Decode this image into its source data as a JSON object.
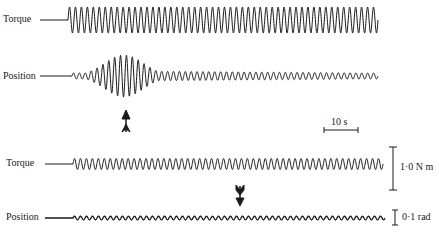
{
  "chart_data": {
    "type": "line",
    "title": "",
    "panels": [
      {
        "name": "upper",
        "traces": [
          {
            "label": "Torque",
            "baseline_y": 20,
            "start_x": 68,
            "end_x": 378,
            "amplitude": "constant large",
            "cycles": 52
          },
          {
            "label": "Position",
            "baseline_y": 76,
            "start_x": 72,
            "end_x": 378,
            "amplitude": "grows to peak near arrow then decays to small steady",
            "cycles": 52
          }
        ],
        "marker": {
          "type": "double-headed vertical arrow",
          "x": 125
        }
      },
      {
        "name": "lower",
        "traces": [
          {
            "label": "Torque",
            "baseline_y": 163,
            "start_x": 73,
            "end_x": 383,
            "amplitude": "constant small",
            "cycles": 52
          },
          {
            "label": "Position",
            "baseline_y": 218,
            "start_x": 73,
            "end_x": 385,
            "amplitude": "very small, steady",
            "cycles": 52
          }
        ],
        "marker": {
          "type": "downward arrow",
          "x": 239
        }
      }
    ],
    "scale_bars": {
      "time": "10 s",
      "torque": "1·0 N m",
      "position": "0·1 rad"
    },
    "grid": false,
    "legend": "none"
  },
  "labels": {
    "torque_top": "Torque",
    "position_top": "Position",
    "torque_bottom": "Torque",
    "position_bottom": "Position",
    "time_scale": "10 s",
    "torque_scale": "1·0 N m",
    "position_scale": "0·1 rad"
  },
  "colors": {
    "trace": "#1a1a1a",
    "background": "#ffffff"
  }
}
